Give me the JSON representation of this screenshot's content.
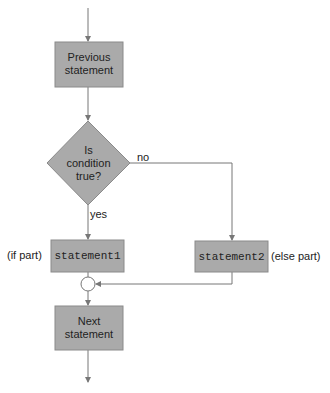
{
  "colors": {
    "node_fill": "#aaaaaa",
    "node_border": "#8a8a8a",
    "line": "#777777",
    "text": "#222222"
  },
  "nodes": {
    "previous": {
      "line1": "Previous",
      "line2": "statement"
    },
    "decision": {
      "line1": "Is",
      "line2": "condition",
      "line3": "true?"
    },
    "statement1": {
      "label": "statement1",
      "annotation": "(if part)"
    },
    "statement2": {
      "label": "statement2",
      "annotation": "(else part)"
    },
    "next": {
      "line1": "Next",
      "line2": "statement"
    }
  },
  "edges": {
    "yes_label": "yes",
    "no_label": "no"
  }
}
